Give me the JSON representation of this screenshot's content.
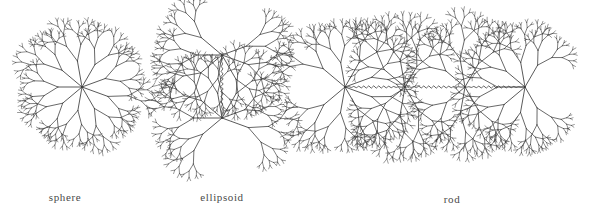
{
  "figure": {
    "background_color": "#ffffff",
    "stroke_color": "#3c3c3c",
    "label_color": "#4a4a4a",
    "canvas": {
      "width": 607,
      "height": 213
    },
    "caption_font_size_px": 11
  },
  "shapes": [
    {
      "id": "sphere",
      "label": "sphere",
      "label_x": 65,
      "label_y": 191,
      "unit_count": 1,
      "orientation": "single",
      "node_centers": [
        {
          "x": 82,
          "y": 87
        }
      ],
      "connectors": [],
      "radius": 57
    },
    {
      "id": "ellipsoid",
      "label": "ellipsoid",
      "label_x": 222,
      "label_y": 191,
      "unit_count": 2,
      "orientation": "vertical",
      "node_centers": [
        {
          "x": 222,
          "y": 55
        },
        {
          "x": 222,
          "y": 118
        }
      ],
      "connectors": [
        {
          "from": {
            "x": 222,
            "y": 55
          },
          "to": {
            "x": 222,
            "y": 118
          },
          "style": "wavy",
          "axis": "vertical"
        }
      ],
      "radius": 57
    },
    {
      "id": "rod",
      "label": "rod",
      "label_x": 452,
      "label_y": 193,
      "unit_count": 4,
      "orientation": "horizontal",
      "node_centers": [
        {
          "x": 345,
          "y": 87
        },
        {
          "x": 405,
          "y": 87
        },
        {
          "x": 465,
          "y": 87
        },
        {
          "x": 525,
          "y": 87
        }
      ],
      "connectors": [
        {
          "from": {
            "x": 345,
            "y": 87
          },
          "to": {
            "x": 405,
            "y": 87
          },
          "style": "wavy",
          "axis": "horizontal"
        },
        {
          "from": {
            "x": 405,
            "y": 87
          },
          "to": {
            "x": 465,
            "y": 87
          },
          "style": "wavy",
          "axis": "horizontal"
        },
        {
          "from": {
            "x": 465,
            "y": 87
          },
          "to": {
            "x": 525,
            "y": 87
          },
          "style": "wavy",
          "axis": "horizontal"
        }
      ],
      "radius": 57
    }
  ],
  "tree_params": {
    "depth": 6,
    "trunk_length": 26,
    "length_ratio": 0.66,
    "branch_angle_deg": 26,
    "stroke_width_root": 0.85,
    "stroke_width_tip": 0.45,
    "primary_branch_angles_deg": [
      20,
      60,
      100,
      140,
      180,
      220,
      260,
      300,
      340
    ]
  }
}
